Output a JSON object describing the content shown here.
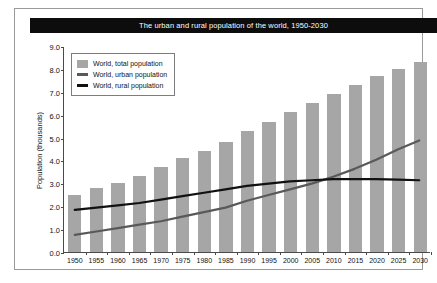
{
  "chart_data": {
    "type": "bar",
    "title": "The urban and rural population of the world, 1950-2030",
    "xlabel": "",
    "ylabel": "Population (thousands)",
    "categories": [
      "1950",
      "1955",
      "1960",
      "1965",
      "1970",
      "1975",
      "1980",
      "1985",
      "1990",
      "1995",
      "2000",
      "2005",
      "2010",
      "2015",
      "2020",
      "2025",
      "2030"
    ],
    "ylim": [
      0.0,
      9.0
    ],
    "ytick_labels": [
      "0.0",
      "1.0",
      "2.0",
      "3.0",
      "4.0",
      "5.0",
      "6.0",
      "7.0",
      "8.0",
      "9.0"
    ],
    "ytick_values": [
      0.0,
      1.0,
      2.0,
      3.0,
      4.0,
      5.0,
      6.0,
      7.0,
      8.0,
      9.0
    ],
    "grid": false,
    "legend_position": "upper-left-inside",
    "series": [
      {
        "name": "World, total population",
        "kind": "bar",
        "color": "#a6a6a6",
        "values": [
          2.5,
          2.8,
          3.0,
          3.3,
          3.7,
          4.1,
          4.4,
          4.8,
          5.3,
          5.7,
          6.1,
          6.5,
          6.9,
          7.3,
          7.7,
          8.0,
          8.3
        ]
      },
      {
        "name": "World, urban population",
        "kind": "line",
        "color": "#595959",
        "values": [
          0.75,
          0.9,
          1.05,
          1.2,
          1.35,
          1.55,
          1.75,
          1.95,
          2.25,
          2.5,
          2.75,
          3.0,
          3.3,
          3.65,
          4.05,
          4.5,
          4.9
        ]
      },
      {
        "name": "World, rural population",
        "kind": "line",
        "color": "#111111",
        "values": [
          1.85,
          1.95,
          2.05,
          2.15,
          2.3,
          2.45,
          2.6,
          2.75,
          2.9,
          3.0,
          3.1,
          3.15,
          3.2,
          3.2,
          3.2,
          3.18,
          3.15
        ]
      }
    ]
  },
  "legend": {
    "items": [
      {
        "label": "World, total population",
        "swatch": "bar-swatch",
        "color": "#a6a6a6"
      },
      {
        "label": "World, urban population",
        "swatch": "line-swatch",
        "color": "#595959"
      },
      {
        "label": "World, rural population",
        "swatch": "line-swatch",
        "color": "#111111"
      }
    ]
  }
}
